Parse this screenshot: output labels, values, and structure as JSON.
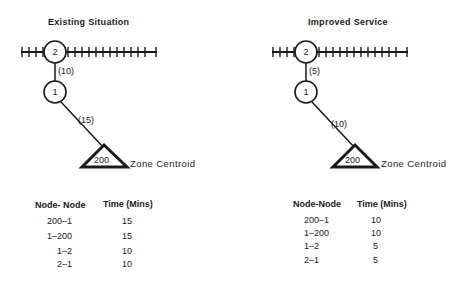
{
  "panels": [
    {
      "title": "Existing Situation",
      "nodes": {
        "rail_station": "2",
        "node1": "1",
        "centroid": "200"
      },
      "links": {
        "rail_to_node1": "(10)",
        "node1_to_centroid": "(15)"
      },
      "centroid_label": "Zone Centroid",
      "table": {
        "headers": [
          "Node- Node",
          "Time (Mins)"
        ],
        "rows": [
          {
            "pair": "200–1",
            "time": "15"
          },
          {
            "pair": "1–200",
            "time": "15"
          },
          {
            "pair": "1–2",
            "time": "10"
          },
          {
            "pair": "2–1",
            "time": "10"
          }
        ]
      }
    },
    {
      "title": "Improved Service",
      "nodes": {
        "rail_station": "2",
        "node1": "1",
        "centroid": "200"
      },
      "links": {
        "rail_to_node1": "(5)",
        "node1_to_centroid": "(10)"
      },
      "centroid_label": "Zone Centroid",
      "table": {
        "headers": [
          "Node-Node",
          "Time (Mins)"
        ],
        "rows": [
          {
            "pair": "200–1",
            "time": "10"
          },
          {
            "pair": "1–200",
            "time": "10"
          },
          {
            "pair": "1–2",
            "time": "5"
          },
          {
            "pair": "2–1",
            "time": "5"
          }
        ]
      }
    }
  ],
  "colors": {
    "ink": "#1a1a1a",
    "background": "#ffffff"
  }
}
